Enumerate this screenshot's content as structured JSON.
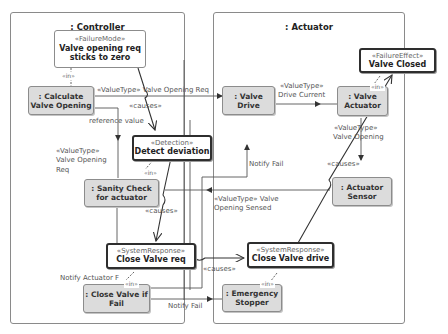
{
  "frames": {
    "controller": {
      "title": ": Controller"
    },
    "actuator": {
      "title": ": Actuator"
    }
  },
  "nodes": {
    "failure_mode": {
      "stereotype": "«FailureMode»",
      "name_line1": "Valve opening req",
      "name_line2": "sticks to zero"
    },
    "calculate_valve_opening": {
      "name_line1": ": Calculate",
      "name_line2": "Valve Opening"
    },
    "detect_deviation": {
      "stereotype": "«Detection»",
      "name": "Detect deviation"
    },
    "sanity_check": {
      "name_line1": ": Sanity Check",
      "name_line2": "for actuator"
    },
    "close_valve_req": {
      "stereotype": "«SystemResponse»",
      "name": "Close Valve req"
    },
    "close_valve_if_fail": {
      "name_line1": ": Close Valve if",
      "name_line2": "Fail"
    },
    "valve_drive": {
      "name_line1": ": Valve",
      "name_line2": "Drive"
    },
    "valve_actuator": {
      "name_line1": ": Valve",
      "name_line2": "Actuator"
    },
    "valve_closed": {
      "stereotype": "«FailureEffect»",
      "name": "Valve Closed"
    },
    "actuator_sensor": {
      "name_line1": ": Actuator",
      "name_line2": "Sensor"
    },
    "close_valve_drive": {
      "stereotype": "«SystemResponse»",
      "name": "Close Valve drive"
    },
    "emergency_stopper": {
      "name_line1": ": Emergency",
      "name_line2": "Stopper"
    }
  },
  "labels": {
    "in_failure_mode": "«in»",
    "in_detect": "«in»",
    "in_close_valve_if_fail": "«in»",
    "in_valve_closed": "«in»",
    "in_emergency": "«in»",
    "valve_opening_req_flow": "«ValueType» Valve Opening Req",
    "causes_1": "«causes»",
    "reference_value": "reference value",
    "valuetype_valve_opening_req_line1": "«ValueType»",
    "valuetype_valve_opening_req_line2": "Valve Opening",
    "valuetype_valve_opening_req_line3": "Req",
    "causes_2": "«causes»",
    "drive_current_line1": "«ValueType»",
    "drive_current_line2": "Drive Current",
    "valve_opening_line1": "«ValueType»",
    "valve_opening_line2": "Valve Opening",
    "causes_3": "«causes»",
    "notify_fail_drive": "Notify Fail",
    "opening_sensed_line1": "«ValueType» Valve",
    "opening_sensed_line2": "Opening Sensed",
    "causes_4": "«causes»",
    "notify_actuator_fail": "Notify Actuator F",
    "notify_fail_stopper": "Notify Fail"
  }
}
